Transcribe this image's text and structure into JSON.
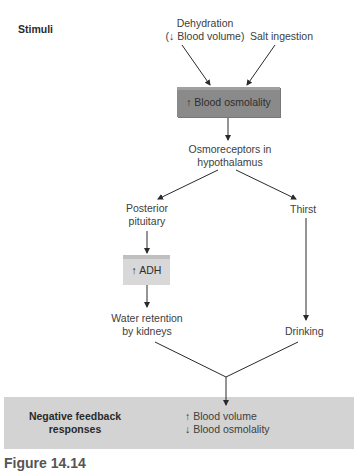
{
  "diagram": {
    "section_labels": {
      "stimuli": "Stimuli",
      "responses_line1": "Negative feedback",
      "responses_line2": "responses"
    },
    "stimuli": {
      "dehydration_line1": "Dehydration",
      "dehydration_line2": "(↓ Blood volume)",
      "salt": "Salt ingestion"
    },
    "nodes": {
      "blood_osmolality": "↑ Blood osmolality",
      "osmoreceptors_line1": "Osmoreceptors in",
      "osmoreceptors_line2": "hypothalamus",
      "posterior_line1": "Posterior",
      "posterior_line2": "pituitary",
      "thirst": "Thirst",
      "adh": "↑ ADH",
      "water_line1": "Water retention",
      "water_line2": "by kidneys",
      "drinking": "Drinking"
    },
    "responses": {
      "line1": "↑ Blood volume",
      "line2": "↓ Blood osmolality"
    },
    "colors": {
      "osmolality_box": "#8a8a8a",
      "adh_box": "#d8d8d8",
      "feedback_band": "#d3d3d3",
      "lines": "#2a2a2a"
    },
    "caption": "Figure 14.14"
  }
}
